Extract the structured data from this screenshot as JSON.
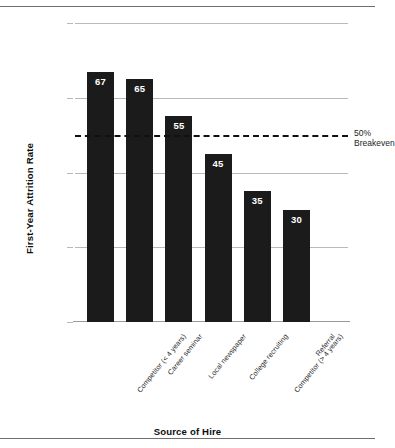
{
  "chart_data": {
    "type": "bar",
    "title": "",
    "xlabel": "Source of Hire",
    "ylabel": "First-Year Attrition Rate",
    "categories": [
      "Competitor (< 4 years)",
      "Career seminar",
      "Local newspaper",
      "College recruiting",
      "Competitor (> 4 years)",
      "Referral"
    ],
    "values": [
      67,
      65,
      55,
      45,
      35,
      30
    ],
    "ylim": [
      0,
      80
    ],
    "yticks": [
      0,
      20,
      40,
      60,
      80
    ],
    "ytick_labels": [
      "0",
      "20",
      "40",
      "60",
      "80%"
    ],
    "grid": "horizontal",
    "legend": "none",
    "bar_color": "#1b1b1b",
    "value_label_color": "#ffffff",
    "annotations": [
      {
        "name": "breakeven",
        "y": 50,
        "style": "dashed-line",
        "line_1": "50%",
        "line_2": "Breakeven"
      }
    ]
  },
  "figure": {
    "y_axis_title": "First-Year Attrition Rate",
    "x_axis_title": "Source of Hire"
  }
}
